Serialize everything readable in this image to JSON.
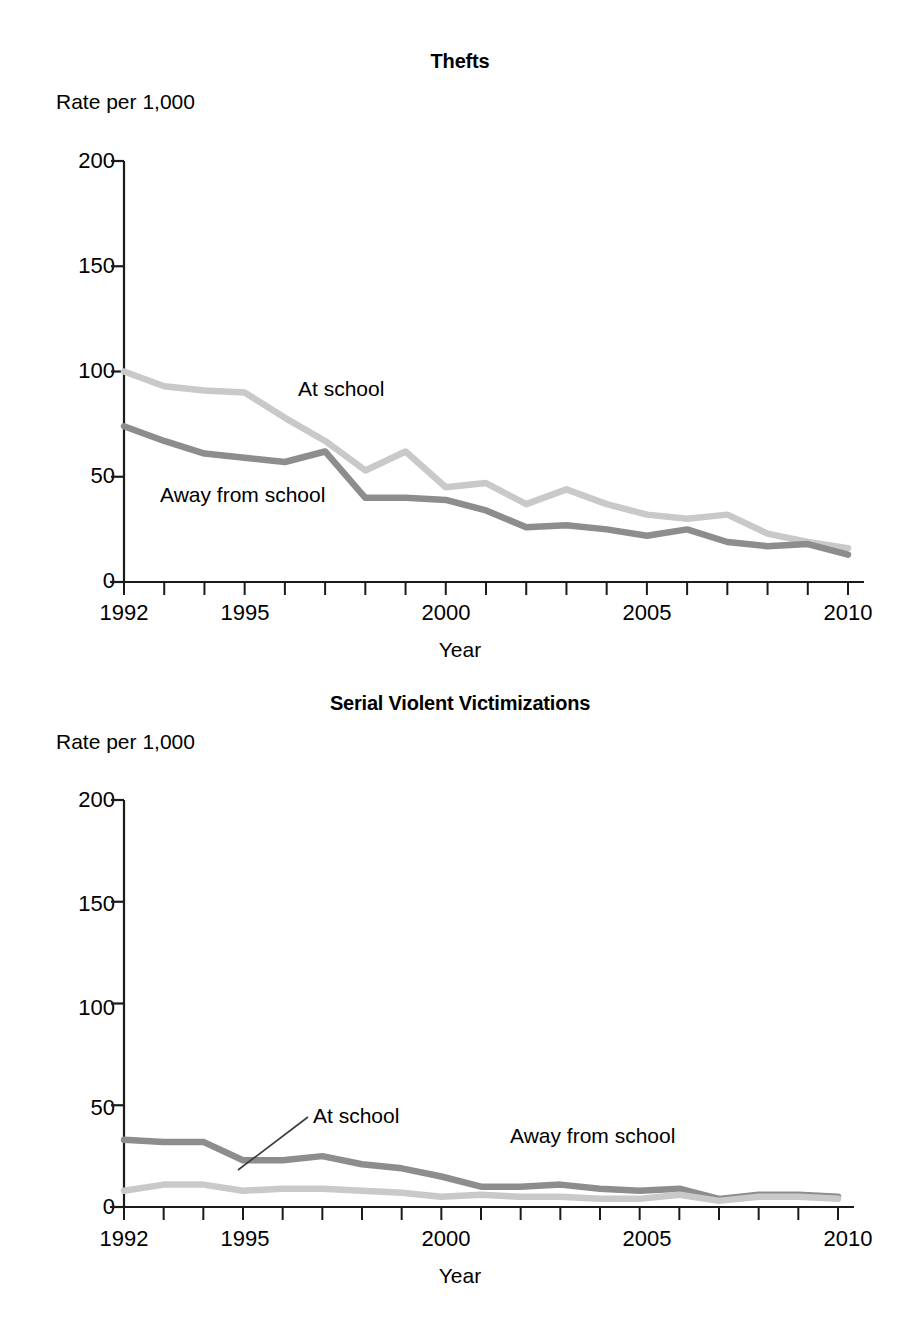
{
  "figure": {
    "x_axis_title": "Year",
    "y_axis_unit": "Rate per 1,000",
    "series_label_at_school": "At school",
    "series_label_away": "Away from school",
    "color_at_school": "#c9c9c9",
    "color_away_from_school": "#8d8d8d",
    "axis_color": "#1a1a1a",
    "background": "#ffffff"
  },
  "panels": {
    "thefts": {
      "title": "Thefts",
      "y_unit": "Rate per 1,000",
      "x_title": "Year",
      "ytick_labels": [
        "200",
        "150",
        "100",
        "50",
        "0"
      ],
      "xtick_labels": [
        "1992",
        "1995",
        "2000",
        "2005",
        "2010"
      ],
      "label_at_school": "At school",
      "label_away_from_school": "Away from school"
    },
    "violent": {
      "title": "Serial Violent Victimizations",
      "y_unit": "Rate per 1,000",
      "x_title": "Year",
      "ytick_labels": [
        "200",
        "150",
        "100",
        "50",
        "0"
      ],
      "xtick_labels": [
        "1992",
        "1995",
        "2000",
        "2005",
        "2010"
      ],
      "label_at_school": "At school",
      "label_away_from_school": "Away from school"
    }
  },
  "chart_data": [
    {
      "type": "line",
      "title": "Thefts",
      "xlabel": "Year",
      "ylabel": "Rate per 1,000",
      "ylim": [
        0,
        200
      ],
      "yticks": [
        0,
        50,
        100,
        150,
        200
      ],
      "xlim": [
        1992,
        2010
      ],
      "xticks": [
        1992,
        1995,
        2000,
        2005,
        2010
      ],
      "grid": false,
      "legend": "inline-annotations",
      "x": [
        1992,
        1993,
        1994,
        1995,
        1996,
        1997,
        1998,
        1999,
        2000,
        2001,
        2002,
        2003,
        2004,
        2005,
        2006,
        2007,
        2008,
        2009,
        2010
      ],
      "series": [
        {
          "name": "At school",
          "color": "#c9c9c9",
          "values": [
            100,
            93,
            91,
            90,
            78,
            67,
            53,
            62,
            45,
            47,
            37,
            44,
            37,
            32,
            30,
            32,
            23,
            19,
            16
          ]
        },
        {
          "name": "Away from school",
          "color": "#8d8d8d",
          "values": [
            74,
            67,
            61,
            59,
            57,
            62,
            40,
            40,
            39,
            34,
            26,
            27,
            25,
            22,
            25,
            19,
            17,
            18,
            13
          ]
        }
      ]
    },
    {
      "type": "line",
      "title": "Serial Violent Victimizations",
      "xlabel": "Year",
      "ylabel": "Rate per 1,000",
      "ylim": [
        0,
        200
      ],
      "yticks": [
        0,
        50,
        100,
        150,
        200
      ],
      "xlim": [
        1992,
        2010
      ],
      "xticks": [
        1992,
        1995,
        2000,
        2005,
        2010
      ],
      "grid": false,
      "legend": "inline-annotations",
      "x": [
        1992,
        1993,
        1994,
        1995,
        1996,
        1997,
        1998,
        1999,
        2000,
        2001,
        2002,
        2003,
        2004,
        2005,
        2006,
        2007,
        2008,
        2009,
        2010
      ],
      "series": [
        {
          "name": "Away from school",
          "color": "#8d8d8d",
          "values": [
            33,
            32,
            32,
            23,
            23,
            25,
            21,
            19,
            15,
            10,
            10,
            11,
            9,
            8,
            9,
            4,
            6,
            6,
            5
          ]
        },
        {
          "name": "At school",
          "color": "#c9c9c9",
          "values": [
            8,
            11,
            11,
            8,
            9,
            9,
            8,
            7,
            5,
            6,
            5,
            5,
            4,
            4,
            6,
            3,
            5,
            5,
            4
          ]
        }
      ]
    }
  ]
}
